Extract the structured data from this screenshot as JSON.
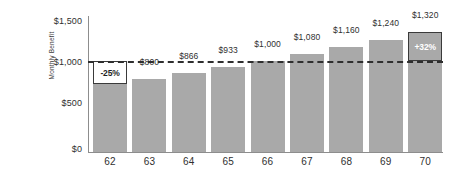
{
  "chart_data": {
    "type": "bar",
    "title": "",
    "xlabel": "",
    "ylabel": "Monthly Benefit",
    "categories": [
      "62",
      "63",
      "64",
      "65",
      "66",
      "67",
      "68",
      "69",
      "70"
    ],
    "values": [
      750,
      800,
      866,
      933,
      1000,
      1080,
      1160,
      1240,
      1320
    ],
    "value_labels": [
      "$750",
      "$800",
      "$866",
      "$933",
      "$1,000",
      "$1,080",
      "$1,160",
      "$1,240",
      "$1,320"
    ],
    "ylim": [
      0,
      1500
    ],
    "ytick_values": [
      1500,
      1000,
      500,
      0
    ],
    "ytick_labels": [
      "$1,500",
      "$1,000",
      "$500",
      "$0"
    ],
    "grid": false,
    "legend": null,
    "bar_color": "#a9a9a9",
    "reference_line": {
      "value": 1000,
      "style": "dashed",
      "color": "#2e2e2e"
    },
    "annotations": [
      {
        "name": "reduction-callout",
        "category": "62",
        "label": "-25%",
        "from_value": 750,
        "to_value": 1000,
        "fill": "#ffffff",
        "text_color": "#1f1f1f",
        "border_color": "#3a3a3a"
      },
      {
        "name": "increase-callout",
        "category": "70",
        "label": "+32%",
        "from_value": 1000,
        "to_value": 1320,
        "fill": "#a9a9a9",
        "text_color": "#ffffff",
        "border_color": "#3a3a3a"
      }
    ]
  }
}
